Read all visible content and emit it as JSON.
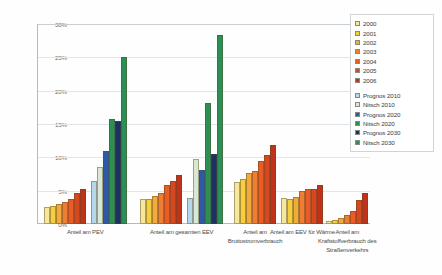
{
  "chart_data": {
    "type": "bar",
    "title": "",
    "xlabel": "",
    "ylabel": "",
    "ylim": [
      0,
      30
    ],
    "ytick_labels": [
      "30%",
      "25%",
      "20%",
      "15%",
      "10%",
      "5%",
      "0%"
    ],
    "ytick_values": [
      30,
      25,
      20,
      15,
      10,
      5,
      0
    ],
    "grid": true,
    "legend_position": "right",
    "unit": "%",
    "categories": [
      "Anteil  am PEV",
      "Anteil am gesamten EEV",
      "Anteil am Bruttostromverbrauch",
      "Anteil am EEV für Wärme",
      "Anteil am Kraftstoffverbrauch des Straßenverkehrs"
    ],
    "category_lines": [
      [
        "Anteil  am PEV"
      ],
      [
        "Anteil am gesamten EEV"
      ],
      [
        "Anteil am",
        "Bruttostromverbrauch"
      ],
      [
        "Anteil am EEV für Wärme"
      ],
      [
        "Anteil am",
        "Kraftstoffverbrauch des",
        "Straßenverkehrs"
      ]
    ],
    "series": [
      {
        "name": "2000",
        "color": "#f5e79e",
        "values": [
          2.6,
          3.8,
          6.3,
          3.9,
          0.4
        ]
      },
      {
        "name": "2001",
        "color": "#f5cf3f",
        "values": [
          2.7,
          3.8,
          6.7,
          3.8,
          0.6
        ]
      },
      {
        "name": "2002",
        "color": "#f0ab3a",
        "values": [
          3.0,
          4.2,
          7.7,
          4.1,
          0.9
        ]
      },
      {
        "name": "2003",
        "color": "#ef7d33",
        "values": [
          3.3,
          4.7,
          8.0,
          4.9,
          1.4
        ]
      },
      {
        "name": "2004",
        "color": "#ec5b24",
        "values": [
          3.8,
          5.8,
          9.5,
          5.2,
          1.9
        ]
      },
      {
        "name": "2005",
        "color": "#d6481f",
        "values": [
          4.6,
          6.4,
          10.3,
          5.3,
          3.6
        ]
      },
      {
        "name": "2006",
        "color": "#c0331a",
        "values": [
          5.3,
          7.4,
          11.8,
          5.9,
          4.7
        ]
      },
      {
        "name": "Prognos 2010",
        "color": "#b6d7ea",
        "values": [
          6.5,
          3.9,
          null,
          null,
          null
        ]
      },
      {
        "name": "Nitsch 2010",
        "color": "#d9e8d2",
        "values": [
          8.5,
          9.8,
          null,
          null,
          null
        ]
      },
      {
        "name": "Prognos 2020",
        "color": "#2b5ba8",
        "values": [
          11.0,
          8.1,
          null,
          null,
          null
        ]
      },
      {
        "name": "Nitsch 2020",
        "color": "#2a9156",
        "values": [
          15.8,
          18.2,
          null,
          null,
          null
        ]
      },
      {
        "name": "Prognos 2030",
        "color": "#1a3263",
        "values": [
          15.4,
          10.5,
          null,
          null,
          null
        ]
      },
      {
        "name": "Nitsch 2030",
        "color": "#2a9156",
        "values": [
          25.1,
          28.4,
          null,
          null,
          null
        ]
      }
    ]
  },
  "legend": {
    "groups": [
      {
        "items": [
          {
            "label": "2000",
            "color": "#f5e79e"
          },
          {
            "label": "2001",
            "color": "#f5cf3f"
          },
          {
            "label": "2002",
            "color": "#f0ab3a"
          },
          {
            "label": "2003",
            "color": "#ef7d33"
          },
          {
            "label": "2004",
            "color": "#ec5b24"
          },
          {
            "label": "2005",
            "color": "#d6481f"
          },
          {
            "label": "2006",
            "color": "#c0331a"
          }
        ]
      },
      {
        "items": [
          {
            "label": "Prognos 2010",
            "color": "#b6d7ea"
          },
          {
            "label": "Nitsch 2010",
            "color": "#d9e8d2"
          },
          {
            "label": "Prognos 2020",
            "color": "#2b5ba8"
          },
          {
            "label": "Nitsch 2020",
            "color": "#2a9156"
          },
          {
            "label": "Prognos 2030",
            "color": "#1a3263"
          },
          {
            "label": " Nitsch 2030",
            "color": "#2a9156"
          }
        ]
      }
    ]
  }
}
